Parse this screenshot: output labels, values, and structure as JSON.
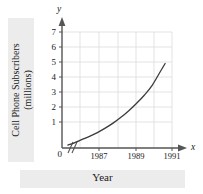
{
  "chart_data": {
    "type": "line",
    "title": "",
    "xlabel": "Year",
    "ylabel": "Cell Phone Subscribers (millions)",
    "ylabel_line1": "Cell Phone Subscribers",
    "ylabel_line2": "(millions)",
    "x_axis_letter": "x",
    "y_axis_letter": "y",
    "xlim": [
      1986,
      1991.6
    ],
    "ylim": [
      0,
      7.5
    ],
    "grid": true,
    "legend": "none",
    "axis_break": "y-axis break after 0 on x-axis",
    "ytick_labels": [
      "7",
      "6",
      "5",
      "4",
      "3",
      "2",
      "1",
      "0"
    ],
    "ytick_values": [
      7,
      6,
      5,
      4,
      3,
      2,
      1,
      0
    ],
    "xtick_labels": [
      "1987",
      "1989",
      "1991"
    ],
    "xtick_values": [
      1987,
      1989,
      1991
    ],
    "series": [
      {
        "name": "Cell Phone Subscribers (millions)",
        "color": "#3b3b3b",
        "x": [
          1986.3,
          1986.6,
          1987.0,
          1987.4,
          1987.8,
          1988.2,
          1988.6,
          1989.0,
          1989.4,
          1989.8,
          1990.2,
          1990.6,
          1991.0,
          1991.25
        ],
        "values": [
          0.18,
          0.3,
          0.5,
          0.7,
          0.93,
          1.2,
          1.5,
          1.85,
          2.25,
          2.7,
          3.2,
          3.8,
          4.6,
          5.1
        ]
      }
    ]
  },
  "figure": {
    "background_color": "#ffffff",
    "band_color": "#ececed",
    "grid_color": "#dcdcdc",
    "axis_color": "#555555",
    "curve_color": "#3b3b3b"
  }
}
